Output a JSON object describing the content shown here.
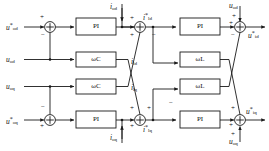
{
  "figure": {
    "line_color": "#1a1a1a",
    "block_fill": "#ffffff"
  },
  "blocks": [
    {
      "id": "pi-d-outer",
      "label": "PI",
      "x": 76,
      "y": 18,
      "w": 40,
      "h": 17
    },
    {
      "id": "wc-d",
      "label": "ωC",
      "x": 76,
      "y": 52,
      "w": 40,
      "h": 15
    },
    {
      "id": "wc-q",
      "label": "ωC",
      "x": 76,
      "y": 79,
      "w": 40,
      "h": 15
    },
    {
      "id": "pi-q-outer",
      "label": "PI",
      "x": 76,
      "y": 111,
      "w": 40,
      "h": 17
    },
    {
      "id": "pi-d-inner",
      "label": "PI",
      "x": 180,
      "y": 18,
      "w": 40,
      "h": 17
    },
    {
      "id": "wl-d",
      "label": "ωL",
      "x": 180,
      "y": 52,
      "w": 40,
      "h": 15
    },
    {
      "id": "wl-q",
      "label": "ωL",
      "x": 180,
      "y": 79,
      "w": 40,
      "h": 15
    },
    {
      "id": "pi-q-inner",
      "label": "PI",
      "x": 180,
      "y": 111,
      "w": 40,
      "h": 17
    }
  ],
  "summing_junctions": [
    {
      "id": "sum-1",
      "cx": 50,
      "cy": 27
    },
    {
      "id": "sum-2",
      "cx": 140,
      "cy": 27
    },
    {
      "id": "sum-3",
      "cx": 50,
      "cy": 120
    },
    {
      "id": "sum-4",
      "cx": 140,
      "cy": 120
    },
    {
      "id": "sum-5",
      "cx": 240,
      "cy": 27
    },
    {
      "id": "sum-6",
      "cx": 240,
      "cy": 120
    }
  ],
  "signals": {
    "uod_ref": {
      "base": "u",
      "sub": "od",
      "sup": "*"
    },
    "uod": {
      "base": "u",
      "sub": "od",
      "sup": ""
    },
    "uoq": {
      "base": "u",
      "sub": "oq",
      "sup": ""
    },
    "uoq_ref": {
      "base": "u",
      "sub": "oq",
      "sup": "*"
    },
    "iod": {
      "base": "i",
      "sub": "od",
      "sup": ""
    },
    "ioq": {
      "base": "i",
      "sub": "oq",
      "sup": ""
    },
    "ild_ref": {
      "base": "i",
      "sub": "ld",
      "sup": "*"
    },
    "ilq_ref": {
      "base": "i",
      "sub": "lq",
      "sup": "*"
    },
    "ild": {
      "base": "i",
      "sub": "ld",
      "sup": ""
    },
    "ilq": {
      "base": "i",
      "sub": "lq",
      "sup": ""
    },
    "uod_top": {
      "base": "u",
      "sub": "od",
      "sup": ""
    },
    "uoq_bot": {
      "base": "u",
      "sub": "oq",
      "sup": ""
    },
    "uid_ref": {
      "base": "u",
      "sub": "id",
      "sup": "*"
    },
    "uiq_ref": {
      "base": "u",
      "sub": "iq",
      "sup": "*"
    }
  },
  "signs": {
    "plus": "+",
    "minus": "−"
  },
  "sign_marks": [
    {
      "id": "sum1-plus",
      "symbol": "+",
      "x": 40,
      "y": 15
    },
    {
      "id": "sum1-minus",
      "symbol": "−",
      "x": 40,
      "y": 33
    },
    {
      "id": "sum2-plus-left",
      "symbol": "+",
      "x": 129,
      "y": 16
    },
    {
      "id": "sum2-plus-low",
      "symbol": "+",
      "x": 129,
      "y": 33
    },
    {
      "id": "sum3-minus",
      "symbol": "−",
      "x": 40,
      "y": 105
    },
    {
      "id": "sum3-plus",
      "symbol": "+",
      "x": 40,
      "y": 125
    },
    {
      "id": "sum4-plus-top",
      "symbol": "+",
      "x": 129,
      "y": 106
    },
    {
      "id": "sum4-plus-left",
      "symbol": "+",
      "x": 129,
      "y": 124
    },
    {
      "id": "sum4-plus-up",
      "symbol": "+",
      "x": 148,
      "y": 106
    },
    {
      "id": "sum5-plus-top",
      "symbol": "+",
      "x": 231,
      "y": 14
    },
    {
      "id": "sum5-plus-left",
      "symbol": "+",
      "x": 228,
      "y": 21
    },
    {
      "id": "sum5-minus",
      "symbol": "−",
      "x": 230,
      "y": 33
    },
    {
      "id": "sum6-plus-top",
      "symbol": "+",
      "x": 230,
      "y": 106
    },
    {
      "id": "sum6-plus-left",
      "symbol": "+",
      "x": 228,
      "y": 124
    },
    {
      "id": "sum6-plus-bot",
      "symbol": "+",
      "x": 230,
      "y": 133
    },
    {
      "id": "sum2-minus-right",
      "symbol": "−",
      "x": 151,
      "y": 33
    },
    {
      "id": "sum4-minus-right",
      "symbol": "−",
      "x": 168,
      "y": 101
    }
  ],
  "labels": [
    {
      "id": "label-uod-ref",
      "signal": "uod_ref",
      "x": 6,
      "y": 22
    },
    {
      "id": "label-uod",
      "signal": "uod",
      "x": 6,
      "y": 57
    },
    {
      "id": "label-uoq",
      "signal": "uoq",
      "x": 6,
      "y": 84
    },
    {
      "id": "label-uoq-ref",
      "signal": "uoq_ref",
      "x": 6,
      "y": 116
    },
    {
      "id": "label-iod",
      "signal": "iod",
      "x": 108,
      "y": 3
    },
    {
      "id": "label-ild-ref",
      "signal": "ild_ref",
      "x": 122,
      "y": 14
    },
    {
      "id": "label-ild",
      "signal": "ild",
      "x": 131,
      "y": 60
    },
    {
      "id": "label-ilq",
      "signal": "ilq",
      "x": 131,
      "y": 86
    },
    {
      "id": "label-ilq-ref",
      "signal": "ilq_ref",
      "x": 122,
      "y": 124
    },
    {
      "id": "label-ioq",
      "signal": "ioq",
      "x": 108,
      "y": 137
    },
    {
      "id": "label-uod-top",
      "signal": "uod_top",
      "x": 214,
      "y": 3
    },
    {
      "id": "label-uid-ref",
      "signal": "uid_ref",
      "x": 250,
      "y": 21
    },
    {
      "id": "label-uiq-ref",
      "signal": "uiq_ref",
      "x": 246,
      "y": 110
    },
    {
      "id": "label-uoq-bot",
      "signal": "uoq_bot",
      "x": 214,
      "y": 138
    }
  ]
}
